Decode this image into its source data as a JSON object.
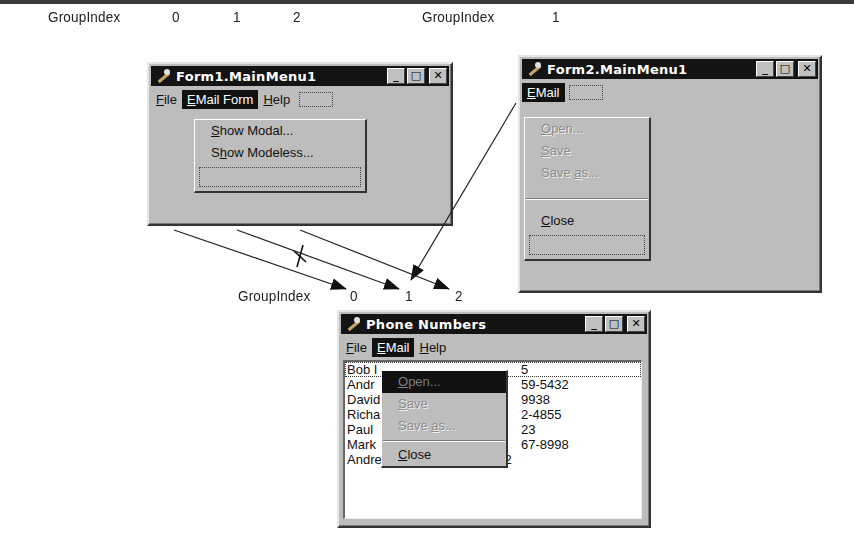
{
  "labels": {
    "form1_groupindex": "GroupIndex",
    "form1_indices": [
      "0",
      "1",
      "2"
    ],
    "form2_groupindex": "GroupIndex",
    "form2_index": "1",
    "merged_groupindex": "GroupIndex",
    "merged_indices": [
      "0",
      "1",
      "2"
    ],
    "blocked_marker": "X"
  },
  "form1": {
    "title": "Form1.MainMenu1",
    "menu": [
      {
        "label": "File",
        "accel": "F",
        "rest": "ile"
      },
      {
        "label": "EMail Form",
        "accel": "E",
        "rest": "Mail Form",
        "active": true
      },
      {
        "label": "Help",
        "accel": "H",
        "rest": "elp"
      }
    ],
    "dropdown": [
      {
        "pre": "",
        "accel": "S",
        "rest": "how Modal..."
      },
      {
        "pre": "S",
        "accel": "h",
        "rest": "ow Modeless..."
      }
    ]
  },
  "form2": {
    "title": "Form2.MainMenu1",
    "menu": [
      {
        "label": "EMail",
        "accel": "E",
        "rest": "Mail",
        "active": true
      }
    ],
    "dropdown": [
      {
        "pre": "",
        "accel": "O",
        "rest": "pen...",
        "disabled": true
      },
      {
        "pre": "",
        "accel": "S",
        "rest": "ave",
        "disabled": true
      },
      {
        "pre": "Save ",
        "accel": "a",
        "rest": "s...",
        "disabled": true
      },
      {
        "pre": "",
        "accel": "C",
        "rest": "lose",
        "disabled": false
      }
    ]
  },
  "phone": {
    "title": "Phone Numbers",
    "menu": [
      {
        "label": "File",
        "accel": "F",
        "rest": "ile"
      },
      {
        "label": "EMail",
        "accel": "E",
        "rest": "Mail",
        "active": true
      },
      {
        "label": "Help",
        "accel": "H",
        "rest": "elp"
      }
    ],
    "dropdown": [
      {
        "pre": "",
        "accel": "O",
        "rest": "pen...",
        "disabled": true,
        "highlighted": true
      },
      {
        "pre": "",
        "accel": "S",
        "rest": "ave",
        "disabled": true
      },
      {
        "pre": "Save ",
        "accel": "a",
        "rest": "s...",
        "disabled": true
      },
      {
        "pre": "",
        "accel": "C",
        "rest": "lose",
        "disabled": false
      }
    ],
    "list": [
      {
        "left": "Bob I",
        "right": "5",
        "focused": true
      },
      {
        "left": "Andr",
        "right": "59-5432"
      },
      {
        "left": "David",
        "right": "9938"
      },
      {
        "left": "Richa",
        "right": "2-4855"
      },
      {
        "left": "Paul",
        "right": "23"
      },
      {
        "left": "Mark",
        "right": "67-8998"
      },
      {
        "left": "Andrew Hurt (345) 343-3332",
        "right": ""
      }
    ]
  },
  "window_buttons": {
    "minimize": "_",
    "maximize": "□",
    "close": "✕"
  }
}
